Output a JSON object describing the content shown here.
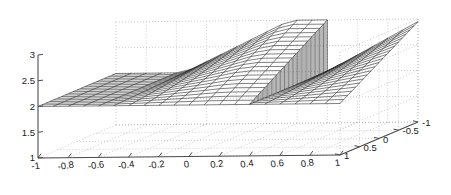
{
  "figure": {
    "background_color": "#ffffff",
    "axis_color": "#4d4d4d",
    "grid_color": "#b3b3b3",
    "mesh_color": "#2b2b2b",
    "tick_label_color": "#1a1a1a",
    "width": 451,
    "height": 195
  },
  "chart_data": {
    "type": "surface",
    "title": "",
    "xlabel": "",
    "ylabel": "",
    "zlabel": "",
    "grid": true,
    "legend": "none",
    "projection": "matlab-default-3d",
    "view": {
      "azimuth": -37.5,
      "elevation": 30
    },
    "xlim": [
      -1,
      1
    ],
    "ylim": [
      -1,
      1
    ],
    "zlim": [
      1,
      3
    ],
    "x_ticks": [
      -1,
      -0.8,
      -0.6,
      -0.4,
      -0.2,
      0,
      0.2,
      0.4,
      0.6,
      0.8,
      1
    ],
    "x_tick_labels": [
      "-1",
      "-0.8",
      "-0.6",
      "-0.4",
      "-0.2",
      "0",
      "0.2",
      "0.4",
      "0.6",
      "0.8",
      "1"
    ],
    "y_ticks": [
      -1,
      -0.5,
      0,
      0.5,
      1
    ],
    "y_tick_labels": [
      "-1",
      "-0.5",
      "0",
      "0.5",
      "1"
    ],
    "z_ticks": [
      1,
      1.5,
      2,
      2.5,
      3
    ],
    "z_tick_labels": [
      "1",
      "1.5",
      "2",
      "2.5",
      "3"
    ],
    "mesh": {
      "nx": 21,
      "ny": 21,
      "description": "Piecewise surface: flat plateau at z=2 for x<0, rising ramp to z=3 in the back region, sharp vertical step discontinuity near x=0.4, sloping sheet descending to the right",
      "base_level": 2.0,
      "plateau_level": 3.0,
      "step_x": 0.4,
      "notch_x": 0.0
    },
    "surface_description": "3D wire mesh of a discontinuous two-variable function with a vertical jump wall",
    "z_values_note": "Surface evaluated on a 21x21 grid over x in [-1,1], y in [-1,1]"
  }
}
